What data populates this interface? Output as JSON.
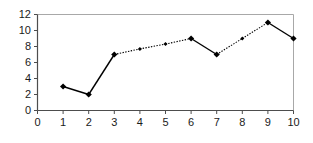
{
  "chart_data": {
    "type": "line",
    "title": "",
    "subtitle": "",
    "xlabel": "",
    "ylabel": "",
    "xlim": [
      0,
      10
    ],
    "ylim": [
      0,
      12
    ],
    "xticks": [
      0,
      1,
      2,
      3,
      4,
      5,
      6,
      7,
      8,
      9,
      10
    ],
    "xticklabels": [
      "0",
      "1",
      "2",
      "3",
      "4",
      "5",
      "6",
      "7",
      "8",
      "9",
      "10"
    ],
    "yticks": [
      0,
      2,
      4,
      6,
      8,
      10,
      12
    ],
    "yticklabels": [
      "0",
      "2",
      "4",
      "6",
      "8",
      "10",
      "12"
    ],
    "grid": false,
    "legend": "none",
    "x": [
      1,
      2,
      3,
      4,
      5,
      6,
      7,
      8,
      9,
      10
    ],
    "values": [
      3,
      2,
      7,
      7.7,
      8.3,
      9,
      7,
      9,
      11,
      9
    ],
    "series": [
      {
        "name": "series-1",
        "x": [
          1,
          2,
          3,
          4,
          5,
          6,
          7,
          8,
          9,
          10
        ],
        "values": [
          3,
          2,
          7,
          7.7,
          8.3,
          9,
          7,
          9,
          11,
          9
        ],
        "color": "#000000",
        "marker": "diamond",
        "marker_sizes": [
          "large",
          "large",
          "large",
          "small",
          "small",
          "large",
          "large",
          "small",
          "large",
          "large"
        ],
        "segment_styles": [
          "solid",
          "solid",
          "dotted",
          "dotted",
          "dotted",
          "solid",
          "dotted",
          "dotted",
          "solid"
        ]
      }
    ],
    "colors": {
      "line": "#000000",
      "marker": "#000000",
      "axis": "#4d4d4d",
      "frame": "#a8a8a8",
      "background": "#ffffff",
      "text": "#1a1a1a"
    }
  }
}
